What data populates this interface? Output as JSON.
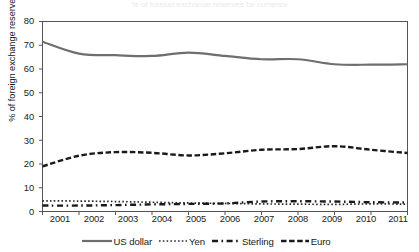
{
  "title": "% of foreign exchange reserves by currency",
  "chart_data": {
    "type": "line",
    "title": "",
    "xlabel": "",
    "ylabel": "% of foreign exchange reserves",
    "x": [
      2001,
      2002,
      2003,
      2004,
      2005,
      2006,
      2007,
      2008,
      2009,
      2010,
      2011
    ],
    "xtick_labels": [
      "2001",
      "2002",
      "2003",
      "2004",
      "2005",
      "2006",
      "2007",
      "2008",
      "2009",
      "2010",
      "2011"
    ],
    "ytick_labels": [
      "0",
      "10",
      "20",
      "30",
      "40",
      "50",
      "60",
      "70",
      "80"
    ],
    "yticks": [
      0,
      10,
      20,
      30,
      40,
      50,
      60,
      70,
      80
    ],
    "ylim": [
      0,
      80
    ],
    "xlim": [
      2001,
      2011
    ],
    "grid": false,
    "legend_position": "bottom",
    "series": [
      {
        "name": "US dollar",
        "style": "solid",
        "color": "#6e6e6e",
        "values": [
          71.5,
          66.5,
          65.8,
          65.5,
          66.9,
          65.5,
          64.1,
          64.1,
          62.0,
          61.8,
          62.0
        ]
      },
      {
        "name": "Yen",
        "style": "dotted",
        "color": "#2b2b2b",
        "values": [
          4.5,
          4.4,
          4.2,
          3.9,
          3.6,
          3.4,
          3.2,
          3.1,
          3.0,
          3.2,
          3.1
        ]
      },
      {
        "name": "Sterling",
        "style": "dash-dot",
        "color": "#1a1a1a",
        "values": [
          2.5,
          2.5,
          2.7,
          3.0,
          3.2,
          3.4,
          4.2,
          4.3,
          4.2,
          3.9,
          3.8
        ]
      },
      {
        "name": "Euro",
        "style": "dashed",
        "color": "#1a1a1a",
        "values": [
          19.0,
          23.5,
          25.0,
          24.7,
          23.6,
          24.5,
          26.0,
          26.3,
          27.5,
          26.0,
          24.6
        ]
      }
    ]
  },
  "legend": {
    "items": [
      {
        "label": "US dollar",
        "style": "solid"
      },
      {
        "label": "Yen",
        "style": "dotted"
      },
      {
        "label": "Sterling",
        "style": "dash-dot"
      },
      {
        "label": "Euro",
        "style": "dashed"
      }
    ]
  }
}
